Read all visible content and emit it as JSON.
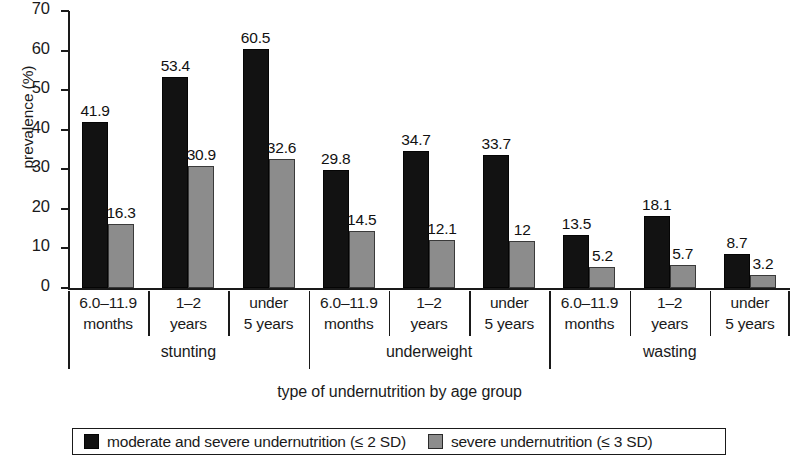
{
  "chart_data": {
    "type": "bar",
    "title": "",
    "xlabel": "type of undernutrition by age group",
    "ylabel": "prevalence (%)",
    "ylim": [
      0,
      70
    ],
    "yticks": [
      0,
      10,
      20,
      30,
      40,
      50,
      60,
      70
    ],
    "grid": false,
    "legend_position": "bottom",
    "categories": [
      "6.0–11.9 months",
      "1–2 years",
      "under 5 years",
      "6.0–11.9 months",
      "1–2 years",
      "under 5 years",
      "6.0–11.9 months",
      "1–2 years",
      "under 5 years"
    ],
    "category_lines": [
      [
        "6.0–11.9",
        "months"
      ],
      [
        "1–2",
        "years"
      ],
      [
        "under",
        "5 years"
      ],
      [
        "6.0–11.9",
        "months"
      ],
      [
        "1–2",
        "years"
      ],
      [
        "under",
        "5 years"
      ],
      [
        "6.0–11.9",
        "months"
      ],
      [
        "1–2",
        "years"
      ],
      [
        "under",
        "5 years"
      ]
    ],
    "groups": [
      {
        "label": "stunting",
        "span": 3
      },
      {
        "label": "underweight",
        "span": 3
      },
      {
        "label": "wasting",
        "span": 3
      }
    ],
    "series": [
      {
        "name": "moderate and severe undernutrition (≤ 2 SD)",
        "color": "#121212",
        "values": [
          41.9,
          53.4,
          60.5,
          29.8,
          34.7,
          33.7,
          13.5,
          18.1,
          8.7
        ],
        "labels": [
          "41.9",
          "53.4",
          "60.5",
          "29.8",
          "34.7",
          "33.7",
          "13.5",
          "18.1",
          "8.7"
        ]
      },
      {
        "name": "severe undernutrition (≤ 3 SD)",
        "color": "#8c8c8c",
        "values": [
          16.3,
          30.9,
          32.6,
          14.5,
          12.1,
          12,
          5.2,
          5.7,
          3.2
        ],
        "labels": [
          "16.3",
          "30.9",
          "32.6",
          "14.5",
          "12.1",
          "12",
          "5.2",
          "5.7",
          "3.2"
        ]
      }
    ]
  },
  "legend": {
    "items": [
      {
        "swatch": "dark",
        "label": "moderate and severe undernutrition (≤ 2 SD)"
      },
      {
        "swatch": "light",
        "label": "severe undernutrition (≤ 3 SD)"
      }
    ]
  }
}
